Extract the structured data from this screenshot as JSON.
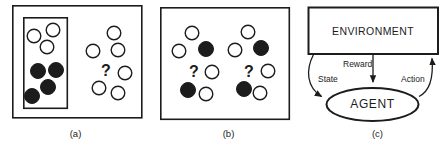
{
  "colors": {
    "ink": "#1c1c1c",
    "paper": "#ffffff"
  },
  "qmark_char": "?",
  "panels": {
    "a": {
      "caption": "(a)",
      "circles": [
        {
          "cx": 34,
          "cy": 36,
          "filled": false
        },
        {
          "cx": 53,
          "cy": 30,
          "filled": false
        },
        {
          "cx": 47,
          "cy": 47,
          "filled": false
        },
        {
          "cx": 38,
          "cy": 71,
          "filled": true
        },
        {
          "cx": 56,
          "cy": 70,
          "filled": true
        },
        {
          "cx": 48,
          "cy": 87,
          "filled": true
        },
        {
          "cx": 32,
          "cy": 96,
          "filled": true
        },
        {
          "cx": 114,
          "cy": 33,
          "filled": false
        },
        {
          "cx": 93,
          "cy": 51,
          "filled": false
        },
        {
          "cx": 118,
          "cy": 50,
          "filled": false
        },
        {
          "cx": 125,
          "cy": 73,
          "filled": false
        },
        {
          "cx": 99,
          "cy": 88,
          "filled": false
        },
        {
          "cx": 118,
          "cy": 93,
          "filled": false
        }
      ],
      "qmarks": [
        {
          "x": 106,
          "y": 76
        }
      ]
    },
    "b": {
      "caption": "(b)",
      "circles": [
        {
          "cx": 192,
          "cy": 33,
          "filled": false
        },
        {
          "cx": 179,
          "cy": 51,
          "filled": false
        },
        {
          "cx": 206,
          "cy": 49,
          "filled": true
        },
        {
          "cx": 212,
          "cy": 72,
          "filled": false
        },
        {
          "cx": 188,
          "cy": 90,
          "filled": true
        },
        {
          "cx": 206,
          "cy": 94,
          "filled": false
        },
        {
          "cx": 248,
          "cy": 32,
          "filled": false
        },
        {
          "cx": 235,
          "cy": 50,
          "filled": false
        },
        {
          "cx": 261,
          "cy": 48,
          "filled": true
        },
        {
          "cx": 268,
          "cy": 71,
          "filled": false
        },
        {
          "cx": 244,
          "cy": 89,
          "filled": true
        },
        {
          "cx": 260,
          "cy": 93,
          "filled": false
        }
      ],
      "qmarks": [
        {
          "x": 194,
          "y": 77
        },
        {
          "x": 249,
          "y": 77
        }
      ]
    },
    "c": {
      "caption": "(c)",
      "environment_label": "ENVIRONMENT",
      "agent_label": "AGENT",
      "edge_labels": {
        "state": "State",
        "reward": "Reward",
        "action": "Action"
      }
    }
  }
}
